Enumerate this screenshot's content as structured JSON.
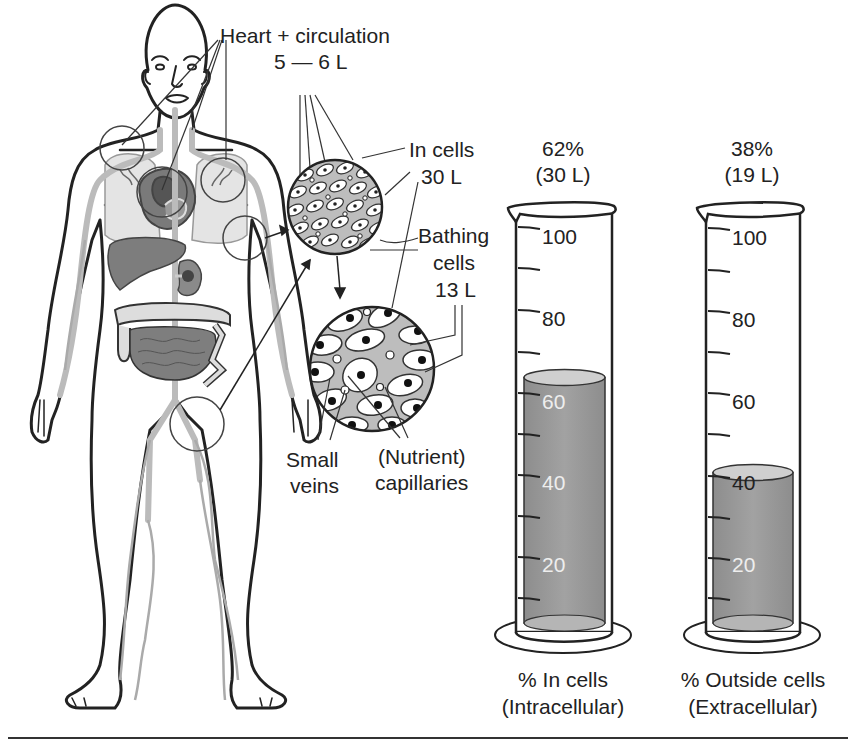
{
  "figure": {
    "labels": {
      "heart_circulation": "Heart + circulation",
      "heart_volume": "5 — 6 L",
      "in_cells": "In cells",
      "in_cells_volume": "30 L",
      "bathing_line1": "Bathing",
      "bathing_line2": "cells",
      "bathing_volume": "13 L",
      "small_veins_line1": "Small",
      "small_veins_line2": "veins",
      "capillaries_line1": "(Nutrient)",
      "capillaries_line2": "capillaries"
    },
    "cylinders": [
      {
        "id": "intracellular",
        "percent_label": "62%",
        "volume_label": "(30 L)",
        "caption_line1": "% In cells",
        "caption_line2": "(Intracellular)",
        "fill_percent": 62
      },
      {
        "id": "extracellular",
        "percent_label": "38%",
        "volume_label": "(19 L)",
        "caption_line1": "% Outside cells",
        "caption_line2": "(Extracellular)",
        "fill_percent": 38
      }
    ],
    "scale_ticks": [
      "100",
      "80",
      "60",
      "40",
      "20"
    ],
    "colors": {
      "line": "#222222",
      "fluid": "#9a9a9a",
      "fluid_top": "#c8c8c8",
      "organ": "#8a8a8a",
      "lung": "#e2e2e2",
      "vessel": "#b8b8b8",
      "tissue": "#bdbdbd"
    }
  },
  "chart_data": {
    "type": "bar",
    "categories": [
      "% In cells (Intracellular)",
      "% Outside cells (Extracellular)"
    ],
    "values": [
      62,
      38
    ],
    "volumes_L": [
      30,
      19
    ],
    "ylim": [
      0,
      100
    ],
    "yticks": [
      20,
      40,
      60,
      80,
      100
    ],
    "annotations": {
      "heart_circulation_L": "5-6",
      "in_cells_L": 30,
      "bathing_cells_L": 13
    }
  }
}
